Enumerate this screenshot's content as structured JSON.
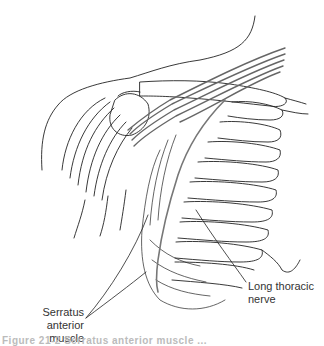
{
  "figure": {
    "labels": {
      "serratus_line1": "Serratus",
      "serratus_line2": "anterior muscle",
      "nerve_line1": "Long thoracic",
      "nerve_line2": "nerve"
    },
    "caption": "Figure 21-2  Serratus anterior muscle ..."
  },
  "colors": {
    "line": "#222222",
    "nerve": "#777777",
    "background": "#ffffff"
  }
}
